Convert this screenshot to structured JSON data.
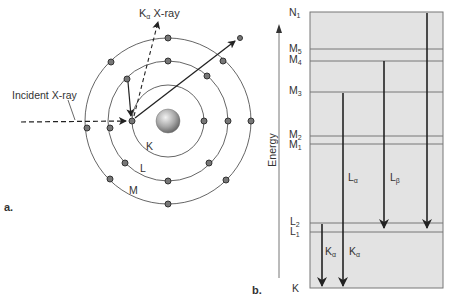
{
  "panel_a": {
    "label": "a.",
    "incident_label": "Incident X-ray",
    "emitted_label_main": "K",
    "emitted_label_sub": "α",
    "emitted_label_rest": " X-ray",
    "shells": [
      {
        "name": "K",
        "radius": 36
      },
      {
        "name": "L",
        "radius": 60
      },
      {
        "name": "M",
        "radius": 83
      }
    ],
    "colors": {
      "shell": "#666666",
      "electron": "#555555",
      "nucleus": "#999999"
    }
  },
  "panel_b": {
    "label": "b.",
    "axis_label": "Energy",
    "levels": [
      {
        "main": "N",
        "sub": "1",
        "y": 12
      },
      {
        "main": "M",
        "sub": "5",
        "y": 49
      },
      {
        "main": "M",
        "sub": "4",
        "y": 61
      },
      {
        "main": "M",
        "sub": "3",
        "y": 92
      },
      {
        "main": "M",
        "sub": "2",
        "y": 136
      },
      {
        "main": "M",
        "sub": "1",
        "y": 144
      },
      {
        "main": "L",
        "sub": "2",
        "y": 223
      },
      {
        "main": "L",
        "sub": "1",
        "y": 232
      },
      {
        "main": "K",
        "sub": "",
        "y": 288
      }
    ],
    "transitions": [
      {
        "main": "L",
        "sub": "α",
        "from": "M3",
        "x": 343
      },
      {
        "main": "L",
        "sub": "β",
        "from": "M4",
        "x": 384
      },
      {
        "main": "",
        "sub": "",
        "from": "N1",
        "x": 427
      },
      {
        "main": "K",
        "sub": "α",
        "from": "L2",
        "x": 322
      },
      {
        "main": "K",
        "sub": "α",
        "from": "M3",
        "x": 343
      }
    ],
    "colors": {
      "box_fill": "#e3e3e3",
      "box_border": "#777777",
      "arrow": "#222222"
    }
  }
}
